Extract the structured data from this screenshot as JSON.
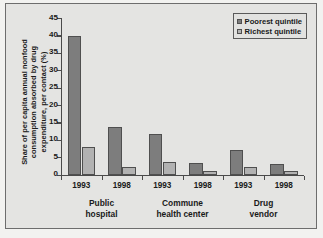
{
  "chart_data": {
    "type": "bar",
    "title": "",
    "xlabel": "",
    "ylabel_lines": [
      "Share of per capita annual nonfood",
      "consumption absorbed by drug",
      "expenditure, per contact (%)"
    ],
    "ylabel": "Share of per capita annual nonfood consumption absorbed by drug expenditure, per contact (%)",
    "ylim": [
      0,
      45
    ],
    "yticks": [
      0,
      5,
      10,
      15,
      20,
      25,
      30,
      35,
      40,
      45
    ],
    "grid": false,
    "legend_position": "top-right",
    "categories": [
      "1993",
      "1998",
      "1993",
      "1998",
      "1993",
      "1998"
    ],
    "groups": [
      {
        "label_lines": [
          "Public",
          "hospital"
        ],
        "label": "Public hospital",
        "years": [
          "1993",
          "1998"
        ]
      },
      {
        "label_lines": [
          "Commune",
          "health center"
        ],
        "label": "Commune health center",
        "years": [
          "1993",
          "1998"
        ]
      },
      {
        "label_lines": [
          "Drug",
          "vendor"
        ],
        "label": "Drug vendor",
        "years": [
          "1993",
          "1998"
        ]
      }
    ],
    "series": [
      {
        "name": "Poorest quintile",
        "color": "#7d7d7d",
        "values": [
          39.9,
          13.7,
          11.8,
          3.5,
          7.0,
          3.0
        ]
      },
      {
        "name": "Richest quintile",
        "color": "#b2b2b2",
        "values": [
          8.1,
          2.2,
          3.6,
          1.0,
          2.3,
          1.2
        ]
      }
    ]
  },
  "legend": {
    "items": [
      {
        "label": "Poorest quintile",
        "swatch": "poorest"
      },
      {
        "label": "Richest quintile",
        "swatch": "richest"
      }
    ]
  },
  "colors": {
    "poorest": "#7d7d7d",
    "richest": "#b2b2b2",
    "axis": "#4a4a4a",
    "background": "#e4e4e2",
    "frame_border": "#6d6d6d"
  }
}
